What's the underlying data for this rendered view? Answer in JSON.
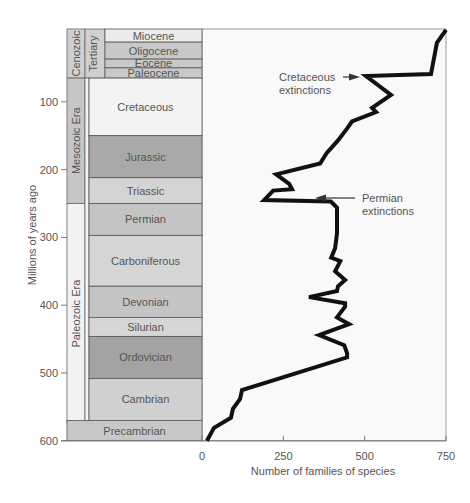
{
  "chart_data": {
    "type": "line",
    "title": "",
    "xlabel": "Number of families of species",
    "ylabel": "Millions of years ago",
    "xlim": [
      0,
      750
    ],
    "ylim": [
      600,
      0
    ],
    "x_ticks": [
      0,
      250,
      500,
      750
    ],
    "y_ticks": [
      100,
      200,
      300,
      400,
      500,
      600
    ],
    "grid": false,
    "series": [
      {
        "name": "Number of families",
        "points": [
          {
            "mya": -6,
            "families": 750
          },
          {
            "mya": 13,
            "families": 722
          },
          {
            "mya": 59,
            "families": 704
          },
          {
            "mya": 62,
            "families": 504
          },
          {
            "mya": 90,
            "families": 581
          },
          {
            "mya": 109,
            "families": 523
          },
          {
            "mya": 115,
            "families": 535
          },
          {
            "mya": 129,
            "families": 461
          },
          {
            "mya": 140,
            "families": 445
          },
          {
            "mya": 157,
            "families": 418
          },
          {
            "mya": 176,
            "families": 383
          },
          {
            "mya": 191,
            "families": 363
          },
          {
            "mya": 207,
            "families": 228
          },
          {
            "mya": 221,
            "families": 268
          },
          {
            "mya": 229,
            "families": 277
          },
          {
            "mya": 231,
            "families": 219
          },
          {
            "mya": 245,
            "families": 191
          },
          {
            "mya": 247,
            "families": 396
          },
          {
            "mya": 256,
            "families": 415
          },
          {
            "mya": 294,
            "families": 415
          },
          {
            "mya": 316,
            "families": 409
          },
          {
            "mya": 330,
            "families": 397
          },
          {
            "mya": 335,
            "families": 425
          },
          {
            "mya": 350,
            "families": 409
          },
          {
            "mya": 363,
            "families": 440
          },
          {
            "mya": 372,
            "families": 418
          },
          {
            "mya": 379,
            "families": 415
          },
          {
            "mya": 388,
            "families": 329
          },
          {
            "mya": 397,
            "families": 440
          },
          {
            "mya": 402,
            "families": 440
          },
          {
            "mya": 418,
            "families": 415
          },
          {
            "mya": 428,
            "families": 452
          },
          {
            "mya": 444,
            "families": 360
          },
          {
            "mya": 459,
            "families": 437
          },
          {
            "mya": 471,
            "families": 446
          },
          {
            "mya": 477,
            "families": 446
          },
          {
            "mya": 525,
            "families": 123
          },
          {
            "mya": 538,
            "families": 117
          },
          {
            "mya": 553,
            "families": 95
          },
          {
            "mya": 566,
            "families": 89
          },
          {
            "mya": 581,
            "families": 37
          },
          {
            "mya": 600,
            "families": 15
          }
        ]
      }
    ],
    "annotations": [
      {
        "text": [
          "Cretaceous",
          "extinctions"
        ],
        "arrow_to": {
          "mya": 67,
          "families": 480
        }
      },
      {
        "text": [
          "Permian",
          "extinctions"
        ],
        "arrow_to": {
          "mya": 250,
          "families": 345
        }
      }
    ],
    "time_scale": {
      "eras": [
        {
          "name": "Cenozoic",
          "from": 0,
          "to": 65
        },
        {
          "name": "Mesozoic Era",
          "from": 65,
          "to": 250
        },
        {
          "name": "Paleozoic Era",
          "from": 250,
          "to": 575
        }
      ],
      "sub_eras": [
        {
          "name": "Tertiary",
          "from": 0,
          "to": 65
        }
      ],
      "periods": [
        {
          "name": "Miocene",
          "from": 0,
          "to": 12,
          "shade": "#ececec"
        },
        {
          "name": "Oligocene",
          "from": 12,
          "to": 37,
          "shade": "#c8c8c8"
        },
        {
          "name": "Eocene",
          "from": 37,
          "to": 50,
          "shade": "#c8c8c8"
        },
        {
          "name": "Paleocene",
          "from": 50,
          "to": 65,
          "shade": "#c8c8c8"
        },
        {
          "name": "Cretaceous",
          "from": 65,
          "to": 150,
          "shade": "#f3f3f3"
        },
        {
          "name": "Jurassic",
          "from": 150,
          "to": 212,
          "shade": "#a9a9a9"
        },
        {
          "name": "Triassic",
          "from": 212,
          "to": 250,
          "shade": "#d4d4d4"
        },
        {
          "name": "Permian",
          "from": 250,
          "to": 297,
          "shade": "#c4c4c4"
        },
        {
          "name": "Carboniferous",
          "from": 297,
          "to": 372,
          "shade": "#d6d6d6"
        },
        {
          "name": "Devonian",
          "from": 372,
          "to": 418,
          "shade": "#c4c4c4"
        },
        {
          "name": "Silurian",
          "from": 418,
          "to": 446,
          "shade": "#d6d6d6"
        },
        {
          "name": "Ordovician",
          "from": 446,
          "to": 508,
          "shade": "#a3a3a3"
        },
        {
          "name": "Cambrian",
          "from": 508,
          "to": 570,
          "shade": "#d0d0d0"
        }
      ],
      "precambrian": {
        "name": "Precambrian",
        "from": 570,
        "to": 600,
        "shade": "#c8c8c8"
      }
    }
  },
  "labels": {
    "xlabel": "Number of families of species",
    "ylabel": "Millions of years ago",
    "cretaceous_line1": "Cretaceous",
    "cretaceous_line2": "extinctions",
    "permian_line1": "Permian",
    "permian_line2": "extinctions"
  },
  "colors": {
    "curve": "#111111",
    "axis": "#777777",
    "frame": "#9a9a9a",
    "text": "#555555",
    "era_mesozoic": "#c6c6c6",
    "era_cenozoic": "#d0d0d0",
    "era_paleozoic": "#f2f2f2",
    "plot_bg": "#f9f9f9"
  }
}
